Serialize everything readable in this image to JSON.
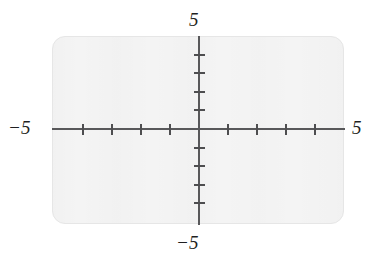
{
  "figure": {
    "name": "cartesian-coordinate-plane",
    "panel": {
      "background_color": "#f4f4f4",
      "border_color": "#e6e6e6"
    },
    "axis_color": "#58585a",
    "tick_color": "#4e4e50",
    "label_color": "#1f1f22"
  },
  "labels": {
    "top": "5",
    "bottom": "−5",
    "left": "−5",
    "right": "5"
  },
  "chart_data": {
    "type": "scatter",
    "title": "",
    "subtitle": "",
    "xlabel": "",
    "ylabel": "",
    "xlim": [
      -5,
      5
    ],
    "ylim": [
      -5,
      5
    ],
    "grid": false,
    "legend": null,
    "series": [],
    "x": [],
    "y": [],
    "annotations": [],
    "x_tick_labels": [
      "−5",
      "5"
    ],
    "y_tick_labels": [
      "−5",
      "5"
    ],
    "x_ticks": [
      -4,
      -3,
      -2,
      -1,
      1,
      2,
      3,
      4
    ],
    "y_ticks": [
      -4,
      -3,
      -2,
      -1,
      1,
      2,
      3,
      4
    ],
    "tick_interval": 1,
    "axis_style": "origin-centered"
  }
}
